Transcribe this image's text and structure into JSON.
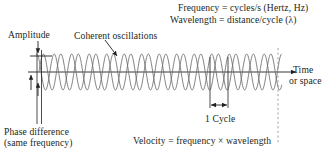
{
  "figure": {
    "background": "#ffffff",
    "ink": "#231f20",
    "wave_color": "#58585b"
  },
  "formulas": {
    "frequency": "Frequency = cycles/s (Hertz, Hz)",
    "wavelength": "Wavelength = distance/cycle (λ)",
    "velocity": "Velocity = frequency × wavelength"
  },
  "labels": {
    "amplitude": "Amplitude",
    "coherent_oscillations": "Coherent oscillations",
    "axis_time": "Time",
    "axis_or_space": "or space",
    "one_cycle": "1 Cycle",
    "phase_difference_line1": "Phase difference",
    "phase_difference_line2": "(same frequency)"
  },
  "chart_data": {
    "type": "line",
    "title": "",
    "xlabel": "Time or space",
    "ylabel": "Amplitude",
    "grid": false,
    "legend": "none",
    "axis": {
      "baseline_y_px": 72,
      "x_start_px": 28,
      "x_end_px": 300,
      "arrowhead": "right"
    },
    "series": [
      {
        "name": "wave-1",
        "amplitude_px": 18,
        "wavelength_px": 17.5,
        "phase_deg": 0,
        "x_start_px": 39,
        "x_end_px": 282
      },
      {
        "name": "wave-2",
        "amplitude_px": 18,
        "wavelength_px": 17.5,
        "phase_deg": 75,
        "x_start_px": 36,
        "x_end_px": 282
      }
    ],
    "annotations": [
      {
        "name": "amplitude-arrow-down",
        "x_px": 38,
        "from_y_px": 44,
        "to_y_px": 57
      },
      {
        "name": "amplitude-arrow-up",
        "x_px": 32,
        "from_y_px": 88,
        "to_y_px": 72
      },
      {
        "name": "coherent-arrow",
        "x1_px": 108,
        "y1_px": 42,
        "x2_px": 118,
        "y2_px": 57
      },
      {
        "name": "one-cycle-span",
        "from_x_px": 210,
        "to_x_px": 228,
        "y_px": 105
      },
      {
        "name": "phase-marker-line-a",
        "x_px": 37,
        "from_y_px": 50,
        "to_y_px": 124
      },
      {
        "name": "phase-marker-line-b",
        "x_px": 41,
        "from_y_px": 50,
        "to_y_px": 124
      },
      {
        "name": "cycle-marker-line-a",
        "x_px": 210,
        "from_y_px": 56,
        "to_y_px": 108
      },
      {
        "name": "cycle-marker-line-b",
        "x_px": 228,
        "from_y_px": 56,
        "to_y_px": 108
      },
      {
        "name": "wave-end-dashed-line",
        "x_px": 278,
        "from_y_px": 48,
        "to_y_px": 142,
        "style": "dashed"
      },
      {
        "name": "amplitude-tick",
        "x_from_px": 32,
        "x_to_px": 52,
        "y_px": 56
      }
    ]
  }
}
